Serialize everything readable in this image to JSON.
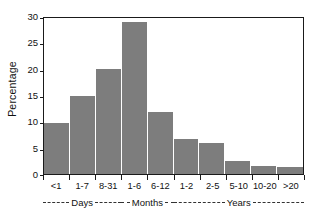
{
  "chart_data": {
    "type": "bar",
    "title": "",
    "xlabel": "",
    "ylabel": "Percentage",
    "categories": [
      "<1",
      "1-7",
      "8-31",
      "1-6",
      "6-12",
      "1-2",
      "2-5",
      "5-10",
      "10-20",
      ">20"
    ],
    "values": [
      9.7,
      14.8,
      20.0,
      28.8,
      11.7,
      6.7,
      5.8,
      2.5,
      1.5,
      1.3
    ],
    "ylim": [
      0,
      30
    ],
    "yticks": [
      0,
      5,
      10,
      15,
      20,
      25,
      30
    ],
    "ytick_labels": [
      "0",
      "5",
      "10",
      "15",
      "20",
      "25",
      "30"
    ],
    "grid": false,
    "legend": "none",
    "bar_color": "#7d7d7d",
    "axis_color": "#1a1a1a",
    "groups": [
      {
        "name": "Days",
        "start_index": 0,
        "end_index": 2
      },
      {
        "name": "Months",
        "start_index": 3,
        "end_index": 4
      },
      {
        "name": "Years",
        "start_index": 5,
        "end_index": 9
      }
    ]
  }
}
